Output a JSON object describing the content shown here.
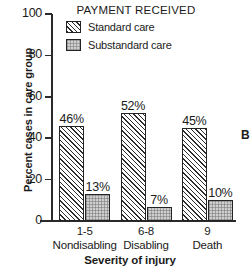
{
  "chart_data": {
    "type": "bar",
    "title": "",
    "legend_title": "PAYMENT RECEIVED",
    "legend_position": "top-center",
    "xlabel": "Severity of injury",
    "ylabel": "Percent cases in care group",
    "ylim": [
      0,
      100
    ],
    "ytick_labels": [
      "0",
      "20",
      "40",
      "60",
      "80",
      "100"
    ],
    "yticks": [
      0,
      20,
      40,
      60,
      80,
      100
    ],
    "grid": false,
    "categories": [
      "1-5",
      "6-8",
      "9"
    ],
    "category_names": [
      "Nondisabling",
      "Disabling",
      "Death"
    ],
    "series": [
      {
        "name": "Standard care",
        "values": [
          46,
          52,
          45
        ],
        "value_labels": [
          "46%",
          "52%",
          "45%"
        ],
        "fill": "diagonal-hatch",
        "color": "#f2f2f2"
      },
      {
        "name": "Substandard care",
        "values": [
          13,
          7,
          10
        ],
        "value_labels": [
          "13%",
          "7%",
          "10%"
        ],
        "fill": "stipple-gray",
        "color": "#cfcfcf"
      }
    ]
  },
  "figure": {
    "panel_letter": "B",
    "axis_color": "#2a2a2a",
    "text_color": "#1b1b1b",
    "background": "#ffffff"
  }
}
